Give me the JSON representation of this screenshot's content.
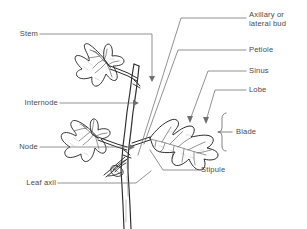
{
  "diagram": {
    "style": "black-and-white pen-and-ink line drawing",
    "background_color": "#ffffff",
    "ink_color": "#2b2b2b",
    "label_color": "#4a4a4a",
    "leader_color": "#6e6e6e"
  },
  "labels": {
    "stem": "Stem",
    "internode": "Internode",
    "node": "Node",
    "leaf_axil": "Leaf axil",
    "axillary_bud_line1": "Axillary or",
    "axillary_bud_line2": "lateral bud",
    "petiole": "Petiole",
    "sinus": "Sinus",
    "lobe": "Lobe",
    "blade": "Blade",
    "stipule": "Stipule"
  }
}
